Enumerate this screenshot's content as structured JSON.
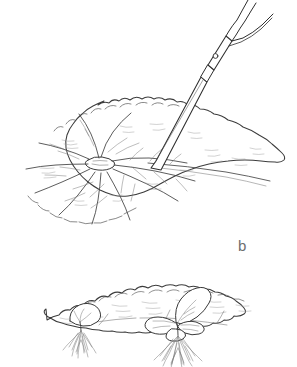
{
  "figure": {
    "kind": "botanical-line-drawing",
    "background_color": "#ffffff",
    "ink_color": "#3a3a3a",
    "shade_color": "#8f8f8f",
    "panels": [
      {
        "id": "a",
        "label": "",
        "caption_visible": false,
        "description": "large rounded begonia leaf seen from above, knife blade cutting across the main veins near the petiole junction",
        "elements": [
          "leaf-blade",
          "crenate-margin",
          "radiating-main-veins",
          "petiole-junction",
          "knife"
        ]
      },
      {
        "id": "b",
        "label": "b",
        "caption_visible": true,
        "description": "same leaf laid flat in side view with two regenerated plantlets and fibrous roots at the cut points",
        "elements": [
          "leaf-blade-flat",
          "plantlet-left",
          "plantlet-right",
          "roots-left",
          "roots-right"
        ]
      }
    ],
    "tool": {
      "name": "knife",
      "parts": [
        "blade",
        "bolster",
        "handle",
        "rivet",
        "tang"
      ],
      "rivet_count": 1
    },
    "plantlets": [
      {
        "id": "plantlet-left",
        "leaf_count": 1,
        "has_roots": true
      },
      {
        "id": "plantlet-right",
        "leaf_count": 4,
        "has_roots": true
      }
    ]
  },
  "labels": {
    "b": "b"
  }
}
